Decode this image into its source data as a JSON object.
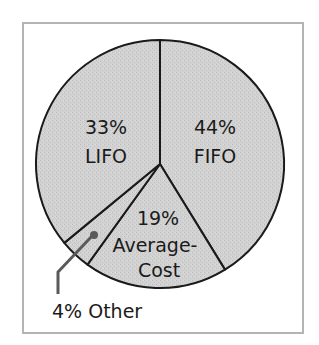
{
  "chart_data": {
    "type": "pie",
    "title": "",
    "start_angle_deg": 0,
    "direction": "clockwise",
    "slices": [
      {
        "label": "FIFO",
        "value": 44,
        "display": "44%"
      },
      {
        "label": "Average-Cost",
        "value": 19,
        "display": "19%"
      },
      {
        "label": "Other",
        "value": 4,
        "display": "4%"
      },
      {
        "label": "LIFO",
        "value": 33,
        "display": "33%"
      }
    ],
    "callout": {
      "slice": "Other",
      "text": "4% Other"
    }
  },
  "labels": {
    "lifo_pct": "33%",
    "lifo_name": "LIFO",
    "fifo_pct": "44%",
    "fifo_name": "FIFO",
    "avg_pct": "19%",
    "avg_name_1": "Average-",
    "avg_name_2": "Cost",
    "other": "4% Other"
  },
  "colors": {
    "slice_fill": "#d2d2d2",
    "slice_stroke": "#1a1a1a",
    "frame": "#b4b4b4",
    "callout": "#5a5a5a"
  }
}
